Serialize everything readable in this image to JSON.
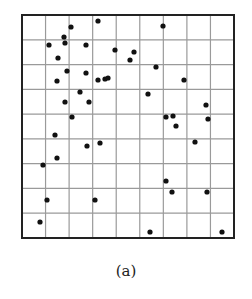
{
  "figure": {
    "caption": "(a)"
  },
  "chart_data": {
    "type": "scatter",
    "title": "",
    "xlabel": "",
    "ylabel": "",
    "grid": true,
    "grid_cols": 9,
    "grid_rows": 9,
    "xlim": [
      0,
      9
    ],
    "ylim": [
      0,
      9
    ],
    "legend": null,
    "caption": "(a)",
    "frame_px": {
      "left": 22,
      "top": 15,
      "right": 234,
      "bottom": 238
    },
    "points_px": [
      [
        98,
        21
      ],
      [
        71,
        27
      ],
      [
        64,
        37
      ],
      [
        65,
        43
      ],
      [
        49,
        45
      ],
      [
        86,
        45
      ],
      [
        115,
        50
      ],
      [
        58,
        58
      ],
      [
        67,
        71
      ],
      [
        86,
        73
      ],
      [
        57,
        81
      ],
      [
        98,
        80
      ],
      [
        105,
        79
      ],
      [
        108,
        78
      ],
      [
        80,
        92
      ],
      [
        65,
        102
      ],
      [
        89,
        102
      ],
      [
        72,
        117
      ],
      [
        163,
        26
      ],
      [
        134,
        52
      ],
      [
        130,
        60
      ],
      [
        156,
        67
      ],
      [
        184,
        80
      ],
      [
        148,
        94
      ],
      [
        206,
        105
      ],
      [
        166,
        117
      ],
      [
        173,
        116
      ],
      [
        208,
        119
      ],
      [
        176,
        126
      ],
      [
        55,
        135
      ],
      [
        87,
        146
      ],
      [
        100,
        143
      ],
      [
        57,
        158
      ],
      [
        43,
        165
      ],
      [
        47,
        200
      ],
      [
        95,
        200
      ],
      [
        40,
        222
      ],
      [
        195,
        142
      ],
      [
        166,
        181
      ],
      [
        172,
        192
      ],
      [
        207,
        192
      ],
      [
        150,
        232
      ],
      [
        222,
        232
      ]
    ],
    "colors": {
      "point": "#111111",
      "grid": "#9a9a9a",
      "frame": "#222222"
    }
  }
}
